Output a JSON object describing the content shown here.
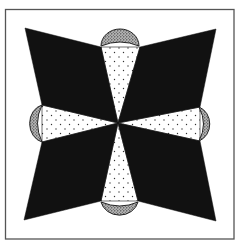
{
  "diagram": {
    "title": "",
    "type": "quilt-block",
    "colors": {
      "background": "#ffffff",
      "frame": "#555555",
      "dark_fill": "#111111",
      "petal_fill": "#ffffff",
      "petal_dots": "#333333",
      "cap_fill": "#9a9a9a",
      "cap_stipple": "#222222"
    },
    "center": [
      118,
      123
    ],
    "frame": {
      "x": 5,
      "y": 9,
      "width": 229,
      "height": 230
    },
    "pieces": {
      "dark_kites": [
        {
          "name": "top-left",
          "points": "25,28 101,47 118,123 42,105"
        },
        {
          "name": "top-right",
          "points": "216,29 140,47 118,123 200,107"
        },
        {
          "name": "bottom-left",
          "points": "24,220 42,142 118,123 101,201"
        },
        {
          "name": "bottom-right",
          "points": "216,221 200,141 118,123 138,201"
        }
      ],
      "petals": [
        {
          "name": "top",
          "points": "118,123 101,47 140,47"
        },
        {
          "name": "bottom",
          "points": "118,123 101,201 138,201"
        },
        {
          "name": "left",
          "points": "118,123 42,105 42,142"
        },
        {
          "name": "right",
          "points": "118,123 200,107 200,141"
        }
      ],
      "caps": [
        {
          "name": "top",
          "d": "M101,46 A19,17 0 0 1 139,46 Q120,38 101,46 Z"
        },
        {
          "name": "bottom",
          "d": "M101,202 A19,17 0 0 0 138,202 Q120,210 101,202 Z"
        },
        {
          "name": "left",
          "d": "M42,105 A16,19 0 0 0 42,142 Q33,123 42,105 Z"
        },
        {
          "name": "right",
          "d": "M199,107 A16,18 0 0 1 199,141 Q208,124 199,107 Z"
        }
      ]
    }
  }
}
